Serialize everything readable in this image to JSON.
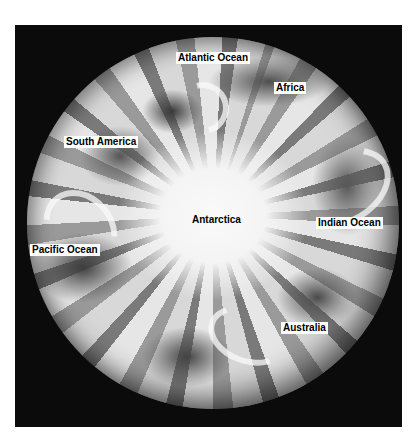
{
  "image": {
    "subject": "Satellite view of Earth centered on the South Pole",
    "background_color": "#0b0b0b"
  },
  "labels": {
    "atlantic": "Atlantic Ocean",
    "africa": "Africa",
    "south_america": "South America",
    "antarctica": "Antarctica",
    "indian": "Indian Ocean",
    "pacific": "Pacific Ocean",
    "australia": "Australia"
  }
}
